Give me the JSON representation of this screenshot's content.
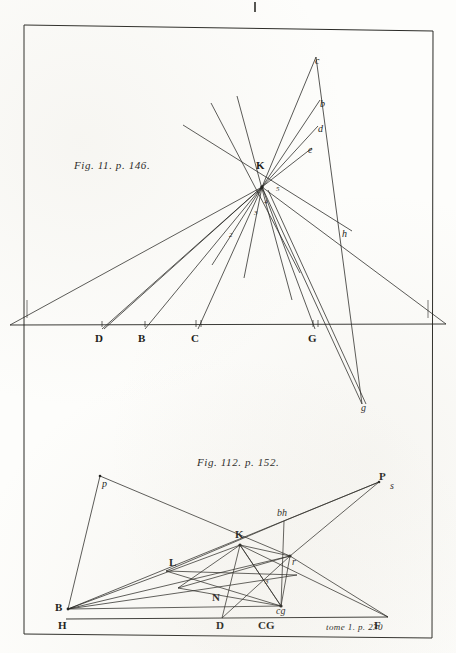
{
  "plate": {
    "background_color": "#fdfdfb",
    "ink_color": "#1a1a18",
    "top_tick_mark": "|",
    "signature": "tome 1. p. 230"
  },
  "figure1": {
    "caption": "Fig. 11. p. 146.",
    "vertex_label": "K",
    "baseline_labels": [
      {
        "text": "D",
        "x": 98,
        "y": 339
      },
      {
        "text": "B",
        "x": 141,
        "y": 339
      },
      {
        "text": "C",
        "x": 194,
        "y": 339
      },
      {
        "text": "G",
        "x": 311,
        "y": 339
      }
    ],
    "ray_labels": [
      {
        "text": "c",
        "x": 317,
        "y": 62
      },
      {
        "text": "b",
        "x": 322,
        "y": 105
      },
      {
        "text": "d",
        "x": 320,
        "y": 130
      },
      {
        "text": "e",
        "x": 310,
        "y": 151
      },
      {
        "text": "h",
        "x": 344,
        "y": 235
      },
      {
        "text": "g",
        "x": 363,
        "y": 409
      }
    ],
    "angle_numbers": [
      {
        "text": "5",
        "x": 277,
        "y": 190
      },
      {
        "text": "4",
        "x": 265,
        "y": 203
      },
      {
        "text": "3",
        "x": 255,
        "y": 214
      },
      {
        "text": "2",
        "x": 230,
        "y": 236
      }
    ]
  },
  "figure2": {
    "caption": "Fig. 112. p. 152.",
    "point_labels": [
      {
        "text": "p",
        "x": 104,
        "y": 485,
        "style": "italic"
      },
      {
        "text": "B",
        "x": 57,
        "y": 608,
        "style": "bold"
      },
      {
        "text": "H",
        "x": 60,
        "y": 626,
        "style": "bold"
      },
      {
        "text": "L",
        "x": 172,
        "y": 563,
        "style": "bold"
      },
      {
        "text": "K",
        "x": 238,
        "y": 535,
        "style": "bold"
      },
      {
        "text": "N",
        "x": 215,
        "y": 598,
        "style": "bold"
      },
      {
        "text": "D",
        "x": 219,
        "y": 626,
        "style": "bold"
      },
      {
        "text": "CG",
        "x": 262,
        "y": 626,
        "style": "bold"
      },
      {
        "text": "cg",
        "x": 277,
        "y": 613,
        "style": "italic"
      },
      {
        "text": "r",
        "x": 292,
        "y": 563,
        "style": "italic"
      },
      {
        "text": "bh",
        "x": 279,
        "y": 515,
        "style": "italic"
      },
      {
        "text": "P",
        "x": 382,
        "y": 478,
        "style": "bold"
      },
      {
        "text": "s",
        "x": 392,
        "y": 487,
        "style": "italic"
      },
      {
        "text": "F",
        "x": 377,
        "y": 626,
        "style": "bold"
      },
      {
        "text": "3",
        "x": 266,
        "y": 583,
        "style": "small"
      }
    ]
  }
}
